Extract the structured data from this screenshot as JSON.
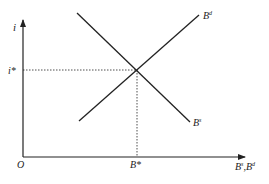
{
  "diagram": {
    "type": "supply-demand",
    "colors": {
      "ink": "#222222",
      "background": "#ffffff"
    },
    "axes": {
      "y_label": "i",
      "x_label_base": "B",
      "x_label_sup1": "s",
      "x_label_sep": ",",
      "x_label_base2": "B",
      "x_label_sup2": "d",
      "origin_label": "O"
    },
    "equilibrium": {
      "rate_label": "i*",
      "quantity_label": "B*"
    },
    "curves": {
      "demand": {
        "base": "B",
        "sup": "d"
      },
      "supply": {
        "base": "B",
        "sup": "s"
      }
    }
  }
}
